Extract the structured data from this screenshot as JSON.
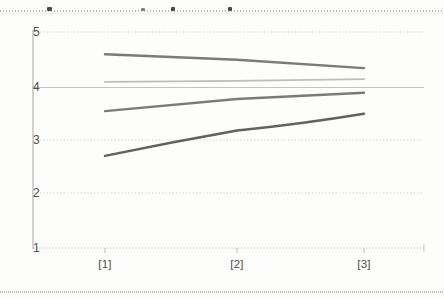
{
  "chart_data": {
    "type": "line",
    "title": "",
    "subtitle": "",
    "xlabel": "",
    "ylabel": "",
    "x": [
      "[1]",
      "[2]",
      "[3]"
    ],
    "categories": [
      "[1]",
      "[2]",
      "[3]"
    ],
    "xtick_labels": [
      "[1]",
      "[2]",
      "[3]"
    ],
    "ytick_labels": [
      "1",
      "2",
      "3",
      "4",
      "5"
    ],
    "yticks": [
      1,
      2,
      3,
      4,
      5
    ],
    "ylim": [
      1,
      5
    ],
    "grid": true,
    "grid_axis": "y",
    "legend": "none",
    "legend_position": "none",
    "series": [
      {
        "name": "Series 1",
        "values": [
          4.6,
          4.5,
          4.35
        ],
        "color": "#6f6f6d",
        "style": "declining"
      },
      {
        "name": "Series 2",
        "values": [
          4.1,
          4.12,
          4.15
        ],
        "color": "#a3a3a1",
        "style": "flat"
      },
      {
        "name": "Series 3",
        "values": [
          3.55,
          3.78,
          3.9
        ],
        "color": "#6f6f6d",
        "style": "rising"
      },
      {
        "name": "Series 4",
        "values": [
          2.7,
          3.18,
          3.5
        ],
        "color": "#545452",
        "style": "rising-steep"
      }
    ]
  },
  "axis": {
    "y_labels": [
      {
        "text": "5",
        "value": 5
      },
      {
        "text": "4",
        "value": 4
      },
      {
        "text": "3",
        "value": 3
      },
      {
        "text": "2",
        "value": 2
      },
      {
        "text": "1",
        "value": 1
      }
    ],
    "x_labels": [
      {
        "text": "[1]",
        "value": 0
      },
      {
        "text": "[2]",
        "value": 1
      },
      {
        "text": "[3]",
        "value": 2
      }
    ]
  },
  "colors": {
    "gridline": "#c9c9c7",
    "axis": "#b5b5b3",
    "text": "#4d4d4b",
    "background": "#fdfdfc"
  }
}
